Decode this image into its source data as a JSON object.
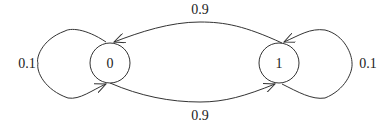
{
  "diagram": {
    "type": "markov-chain-state-diagram",
    "states": [
      {
        "id": "0",
        "label": "0"
      },
      {
        "id": "1",
        "label": "1"
      }
    ],
    "transitions": [
      {
        "from": "0",
        "to": "0",
        "label": "0.1"
      },
      {
        "from": "0",
        "to": "1",
        "label": "0.9"
      },
      {
        "from": "1",
        "to": "0",
        "label": "0.9"
      },
      {
        "from": "1",
        "to": "1",
        "label": "0.1"
      }
    ]
  },
  "colors": {
    "stroke": "#333333",
    "background": "#ffffff"
  }
}
